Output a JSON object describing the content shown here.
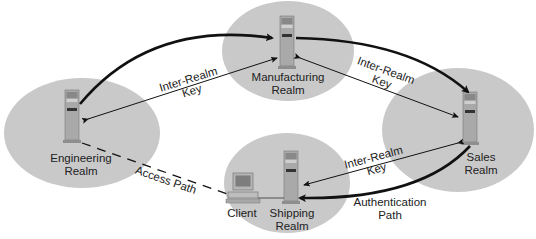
{
  "diagram": {
    "colors": {
      "realm_fill": "#c9c9c9",
      "server_fill": "#a9a9a9",
      "arrow": "#111111"
    },
    "realms": [
      {
        "id": "engineering",
        "name": "Engineering Realm",
        "line1": "Engineering",
        "line2": "Realm"
      },
      {
        "id": "manufacturing",
        "name": "Manufacturing Realm",
        "line1": "Manufacturing",
        "line2": "Realm"
      },
      {
        "id": "sales",
        "name": "Sales Realm",
        "line1": "Sales",
        "line2": "Realm"
      },
      {
        "id": "shipping",
        "name": "Shipping Realm",
        "line1": "Shipping",
        "line2": "Realm"
      }
    ],
    "nodes": {
      "client": "Client"
    },
    "edges": [
      {
        "from": "engineering",
        "to": "manufacturing",
        "label1": "Inter-Realm",
        "label2": "Key"
      },
      {
        "from": "manufacturing",
        "to": "sales",
        "label1": "Inter-Realm",
        "label2": "Key"
      },
      {
        "from": "sales",
        "to": "shipping",
        "label1": "Inter-Realm",
        "label2": "Key"
      },
      {
        "from": "client",
        "to": "engineering",
        "label": "Access Path",
        "style": "dashed"
      }
    ],
    "auth_path": {
      "line1": "Authentication",
      "line2": "Path"
    }
  }
}
